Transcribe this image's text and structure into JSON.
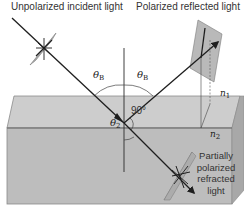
{
  "figure": {
    "labels": {
      "incident": "Unpolarized incident light",
      "reflected": "Polarized reflected light",
      "refracted_lines": [
        "Partially",
        "polarized",
        "refracted",
        "light"
      ],
      "theta_b_left": "θ",
      "theta_b_left_sub": "B",
      "theta_b_right": "θ",
      "theta_b_right_sub": "B",
      "theta_2": "θ",
      "theta_2_sub": "2",
      "right_angle": "90°",
      "n1": "n",
      "n1_sub": "1",
      "n2": "n",
      "n2_sub": "2"
    },
    "colors": {
      "slab_top": "#c9c9c9",
      "slab_front": "#b9b9b9",
      "slab_side": "#a4a4a4",
      "slab_edge": "#7a7a7a",
      "ray": "#1e1e1e",
      "polarizer_fill": "#b3b3b3",
      "text": "#333333"
    }
  }
}
